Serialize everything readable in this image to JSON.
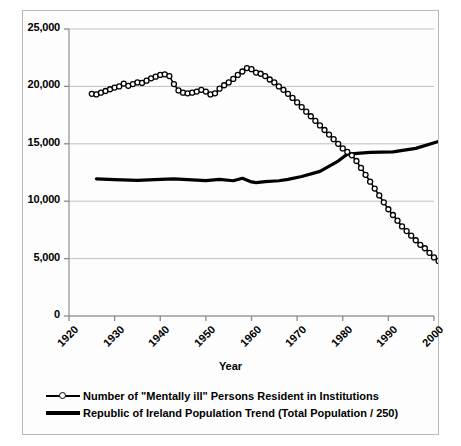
{
  "chart_data": {
    "type": "line",
    "title": "",
    "xlabel": "Year",
    "ylabel": "",
    "grid": true,
    "legend_position": "bottom",
    "xlim": [
      1920,
      2000
    ],
    "ylim": [
      0,
      25000
    ],
    "x_ticks": [
      "1920",
      "1930",
      "1940",
      "1950",
      "1960",
      "1970",
      "1980",
      "1990",
      "2000"
    ],
    "y_ticks": [
      "0",
      "5,000",
      "10,000",
      "15,000",
      "20,000",
      "25,000"
    ],
    "series": [
      {
        "name": "Number of \"Mentally ill\" Persons Resident in Institutions",
        "marker": "open-circle",
        "line_style": "thin-solid",
        "color": "#000000",
        "x": [
          1925,
          1926,
          1927,
          1928,
          1929,
          1930,
          1931,
          1932,
          1933,
          1934,
          1935,
          1936,
          1937,
          1938,
          1939,
          1940,
          1941,
          1942,
          1943,
          1944,
          1945,
          1946,
          1947,
          1948,
          1949,
          1950,
          1951,
          1952,
          1953,
          1954,
          1955,
          1956,
          1957,
          1958,
          1959,
          1960,
          1961,
          1962,
          1963,
          1964,
          1965,
          1966,
          1967,
          1968,
          1969,
          1970,
          1971,
          1972,
          1973,
          1974,
          1975,
          1976,
          1977,
          1978,
          1979,
          1980,
          1981,
          1982,
          1983,
          1984,
          1985,
          1986,
          1987,
          1988,
          1989,
          1990,
          1991,
          1992,
          1993,
          1994,
          1995,
          1996,
          1997,
          1998,
          1999,
          2000,
          2001
        ],
        "values": [
          19350,
          19300,
          19450,
          19600,
          19750,
          19900,
          20000,
          20250,
          20050,
          20200,
          20350,
          20300,
          20500,
          20700,
          20850,
          21000,
          21050,
          20900,
          20200,
          19650,
          19450,
          19400,
          19450,
          19550,
          19700,
          19550,
          19300,
          19400,
          19800,
          20100,
          20350,
          20650,
          21000,
          21300,
          21600,
          21500,
          21200,
          21100,
          20900,
          20600,
          20350,
          20000,
          19700,
          19350,
          19000,
          18600,
          18200,
          17800,
          17400,
          17000,
          16600,
          16200,
          15800,
          15400,
          15000,
          14600,
          14300,
          14000,
          13500,
          12900,
          12300,
          11700,
          11100,
          10500,
          9900,
          9300,
          8800,
          8300,
          7800,
          7400,
          7000,
          6600,
          6200,
          5900,
          5500,
          5100,
          4800
        ]
      },
      {
        "name": "Republic of Ireland Population Trend (Total Population / 250)",
        "marker": "none",
        "line_style": "thick-solid",
        "color": "#000000",
        "x": [
          1926,
          1930,
          1935,
          1940,
          1943,
          1946,
          1950,
          1953,
          1956,
          1958,
          1960,
          1961,
          1963,
          1966,
          1968,
          1971,
          1975,
          1979,
          1981,
          1986,
          1991,
          1996,
          2001
        ],
        "values": [
          11950,
          11880,
          11820,
          11900,
          11950,
          11880,
          11800,
          11900,
          11780,
          12000,
          11680,
          11620,
          11700,
          11780,
          11900,
          12150,
          12600,
          13500,
          14100,
          14250,
          14300,
          14600,
          15200
        ]
      }
    ]
  },
  "axis": {
    "x_title": "Year"
  },
  "legend": {
    "items": [
      {
        "label": "Number of \"Mentally ill\" Persons Resident in Institutions",
        "key": "line-with-circle-marker"
      },
      {
        "label": "Republic of Ireland Population Trend (Total Population / 250)",
        "key": "thick-line"
      }
    ]
  }
}
